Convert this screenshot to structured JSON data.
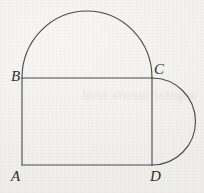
{
  "figure": {
    "background_color": "#f5f4f2",
    "stroke_color": "#4a4a4a",
    "stroke_width": 1.1,
    "label_color": "#2f2f2f",
    "bleed_through_text": "angular inertia food",
    "vertices": {
      "A": {
        "label": "A",
        "x": 22,
        "y": 165
      },
      "B": {
        "label": "B",
        "x": 22,
        "y": 78
      },
      "C": {
        "label": "C",
        "x": 152,
        "y": 78
      },
      "D": {
        "label": "D",
        "x": 152,
        "y": 165
      }
    },
    "segments": [
      {
        "name": "AB",
        "x1": 22,
        "y1": 165,
        "x2": 22,
        "y2": 78
      },
      {
        "name": "BC",
        "x1": 22,
        "y1": 78,
        "x2": 152,
        "y2": 78
      },
      {
        "name": "CD",
        "x1": 152,
        "y1": 78,
        "x2": 152,
        "y2": 165
      },
      {
        "name": "DA",
        "x1": 152,
        "y1": 165,
        "x2": 22,
        "y2": 165
      }
    ],
    "arcs": [
      {
        "name": "semicircle-on-BC",
        "path": "M 22 78 A 65 67 0 0 1 152 78",
        "diameter_endpoints": "B-C",
        "radius": 65,
        "direction": "above"
      },
      {
        "name": "semicircle-on-CD",
        "path": "M 152 78 A 43.5 43.5 0 0 1 152 165",
        "diameter_endpoints": "C-D",
        "radius": 43.5,
        "direction": "right"
      }
    ]
  }
}
